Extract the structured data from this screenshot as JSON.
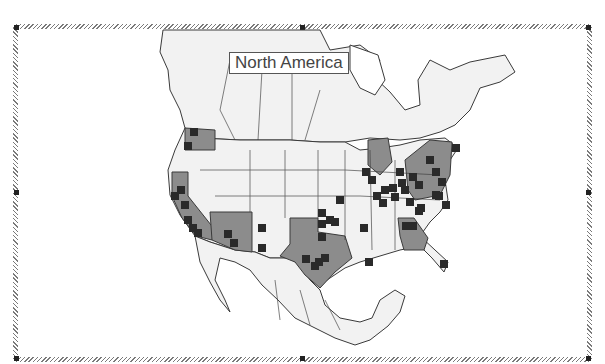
{
  "map": {
    "title": "North America",
    "colors": {
      "land": "#f2f2f2",
      "border": "#3a3a3a",
      "highlight": "#8c8c8c",
      "marker": "#2a2a2a",
      "frame": "#7a7a7a"
    },
    "highlighted_regions": [
      "Washington",
      "California",
      "Arizona",
      "Texas",
      "Georgia",
      "Pennsylvania",
      "New York",
      "Michigan",
      "Ohio"
    ],
    "marker_count": 50,
    "markers": [
      [
        194,
        132
      ],
      [
        188,
        146
      ],
      [
        181,
        190
      ],
      [
        175,
        196
      ],
      [
        185,
        205
      ],
      [
        188,
        220
      ],
      [
        193,
        228
      ],
      [
        198,
        233
      ],
      [
        228,
        234
      ],
      [
        234,
        243
      ],
      [
        262,
        228
      ],
      [
        262,
        248
      ],
      [
        322,
        213
      ],
      [
        322,
        224
      ],
      [
        330,
        220
      ],
      [
        322,
        237
      ],
      [
        319,
        262
      ],
      [
        315,
        266
      ],
      [
        325,
        258
      ],
      [
        306,
        259
      ],
      [
        340,
        200
      ],
      [
        335,
        222
      ],
      [
        364,
        228
      ],
      [
        369,
        262
      ],
      [
        366,
        172
      ],
      [
        372,
        180
      ],
      [
        385,
        190
      ],
      [
        377,
        196
      ],
      [
        383,
        203
      ],
      [
        393,
        188
      ],
      [
        395,
        197
      ],
      [
        400,
        172
      ],
      [
        402,
        183
      ],
      [
        405,
        190
      ],
      [
        413,
        177
      ],
      [
        419,
        185
      ],
      [
        410,
        202
      ],
      [
        419,
        211
      ],
      [
        430,
        160
      ],
      [
        436,
        172
      ],
      [
        442,
        182
      ],
      [
        439,
        196
      ],
      [
        446,
        205
      ],
      [
        456,
        148
      ],
      [
        406,
        226
      ],
      [
        413,
        226
      ],
      [
        421,
        208
      ],
      [
        436,
        195
      ],
      [
        444,
        264
      ]
    ]
  },
  "frame": {
    "selected": true,
    "handles": [
      "top-left",
      "top-center",
      "top-right",
      "middle-left",
      "middle-right",
      "bottom-left",
      "bottom-center",
      "bottom-right"
    ]
  }
}
